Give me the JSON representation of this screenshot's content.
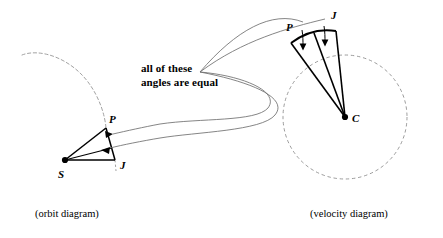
{
  "figure": {
    "background_color": "#ffffff",
    "ink_color": "#000000",
    "guide_color": "#8a8a8a",
    "width": 443,
    "height": 238
  },
  "annotation": {
    "line1": "all of these",
    "line2": "angles are equal"
  },
  "captions": {
    "orbit": "(orbit diagram)",
    "velocity": "(velocity diagram)"
  },
  "orbit_diagram": {
    "center_label": "S",
    "point_p_label": "P",
    "point_j_label": "J",
    "center": {
      "x": 65,
      "y": 160
    },
    "point_p": {
      "x": 106,
      "y": 128
    },
    "point_j": {
      "x": 115,
      "y": 160
    },
    "orbit_curve": "dashed elliptical arc",
    "angle_arc": "arc from P to J about S",
    "arrow_count": 2,
    "arrow_direction": "left"
  },
  "velocity_diagram": {
    "center_label": "C",
    "point_p_label": "P",
    "point_j_label": "J",
    "center": {
      "x": 345,
      "y": 117
    },
    "radius": 62,
    "point_p": {
      "x": 289,
      "y": 40
    },
    "point_j": {
      "x": 331,
      "y": 29
    },
    "circle_style": "dashed",
    "angle_arc": "bold arc from P to J",
    "arrow_count": 2,
    "arrow_direction": "down",
    "radii_count": 3
  },
  "connectors": {
    "count": 4,
    "apex": {
      "x": 200,
      "y": 72
    },
    "style": "thin curved leader lines",
    "targets": [
      "velocity diagram arrow 1",
      "velocity diagram arrow 2",
      "orbit diagram arrow 1",
      "orbit diagram arrow 2"
    ]
  }
}
